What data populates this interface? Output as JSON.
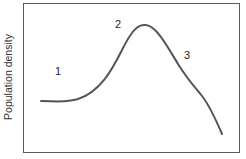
{
  "chart_data": {
    "type": "line",
    "title": "",
    "xlabel": "",
    "ylabel": "Population density",
    "grid": false,
    "annotations": [
      {
        "label": "1",
        "x": 57,
        "y": 73
      },
      {
        "label": "2",
        "x": 118,
        "y": 26
      },
      {
        "label": "3",
        "x": 186,
        "y": 57
      }
    ],
    "curve_path": "M41,101 C55,101 65,103 78,99 C100,92 112,70 122,50 C132,30 138,24 146,25 C156,26 166,44 178,64 C188,80 194,86 202,96 C210,106 216,120 222,134",
    "colors": {
      "line": "#555555",
      "frame": "#5a5a5a"
    }
  }
}
